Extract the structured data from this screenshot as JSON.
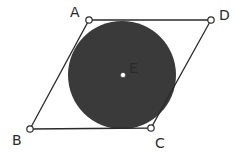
{
  "diagram": {
    "type": "geometry",
    "colors": {
      "background": "#ffffff",
      "stroke": "#2a2a2a",
      "circle_fill": "#3a3a3a",
      "point_fill": "#ffffff"
    },
    "points": {
      "A": {
        "label": "A",
        "x": 89,
        "y": 20,
        "label_x": 70,
        "label_y": 17
      },
      "B": {
        "label": "B",
        "x": 30,
        "y": 129,
        "label_x": 12,
        "label_y": 145
      },
      "C": {
        "label": "C",
        "x": 151,
        "y": 128,
        "label_x": 155,
        "label_y": 148
      },
      "D": {
        "label": "D",
        "x": 211,
        "y": 20,
        "label_x": 219,
        "label_y": 20
      },
      "E": {
        "label": "E",
        "x": 123,
        "y": 75,
        "label_x": 129,
        "label_y": 73
      }
    },
    "circle": {
      "cx": 122,
      "cy": 75,
      "r": 54
    },
    "polygon_order": [
      "A",
      "D",
      "C",
      "B"
    ]
  }
}
